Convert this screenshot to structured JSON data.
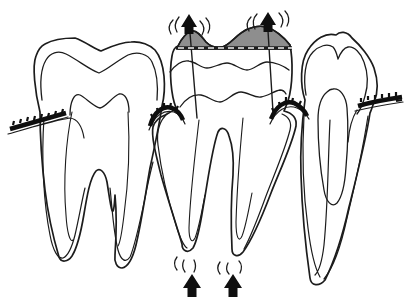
{
  "colors": {
    "background": "#ffffff",
    "ink": "#1c1c1c",
    "shade": "#8e8e8e",
    "solid": "#0f0f0f",
    "dash_light": "#f2f2f2"
  },
  "diagram": {
    "type": "dental-illustration",
    "teeth": [
      {
        "name": "left-molar",
        "roots": 2
      },
      {
        "name": "middle-molar-extruded",
        "roots": 2,
        "shaded_occlusal_cusps": true,
        "dashed_occlusal_line": true
      },
      {
        "name": "right-premolar",
        "roots": 1
      }
    ],
    "arrows": [
      {
        "name": "occlusal-up-arrow-left",
        "direction": "up"
      },
      {
        "name": "occlusal-up-arrow-right",
        "direction": "up"
      },
      {
        "name": "apical-up-arrow-left",
        "direction": "up"
      },
      {
        "name": "apical-up-arrow-right",
        "direction": "up"
      }
    ],
    "calculus_marks": [
      {
        "name": "gingival-mark-far-left"
      },
      {
        "name": "gingival-mark-mesial-cervical"
      },
      {
        "name": "gingival-mark-distal-cervical"
      },
      {
        "name": "gingival-mark-far-right"
      }
    ],
    "motion_line_clusters": 4
  }
}
